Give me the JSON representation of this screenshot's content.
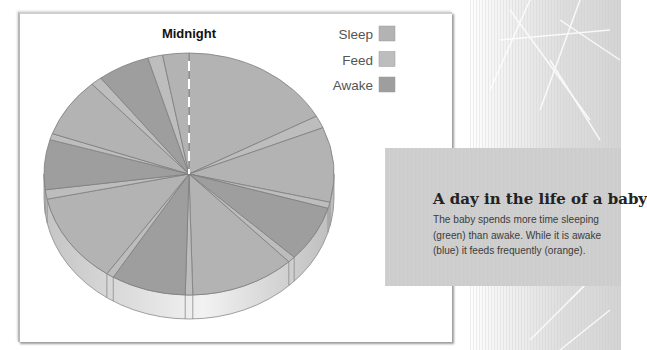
{
  "chart_data": {
    "type": "pie",
    "title": "Midnight",
    "start_label": "Midnight",
    "unit": "hours",
    "total": 24,
    "direction": "clockwise from midnight (top)",
    "legend": [
      {
        "label": "Sleep",
        "color": "#b3b3b3"
      },
      {
        "label": "Feed",
        "color": "#bdbdbd"
      },
      {
        "label": "Awake",
        "color": "#9e9e9e"
      }
    ],
    "legend_position": "top-right",
    "segments": [
      {
        "category": "Sleep",
        "hours": 4.1
      },
      {
        "category": "Feed",
        "hours": 0.4
      },
      {
        "category": "Sleep",
        "hours": 2.4
      },
      {
        "category": "Feed",
        "hours": 0.2
      },
      {
        "category": "Awake",
        "hours": 1.8
      },
      {
        "category": "Feed",
        "hours": 0.2
      },
      {
        "category": "Sleep",
        "hours": 2.8
      },
      {
        "category": "Feed",
        "hours": 0.2
      },
      {
        "category": "Awake",
        "hours": 2.0
      },
      {
        "category": "Feed",
        "hours": 0.2
      },
      {
        "category": "Sleep",
        "hours": 2.9
      },
      {
        "category": "Feed",
        "hours": 0.3
      },
      {
        "category": "Awake",
        "hours": 1.6
      },
      {
        "category": "Feed",
        "hours": 0.2
      },
      {
        "category": "Sleep",
        "hours": 1.9
      },
      {
        "category": "Feed",
        "hours": 0.3
      },
      {
        "category": "Awake",
        "hours": 1.4
      },
      {
        "category": "Feed",
        "hours": 0.4
      },
      {
        "category": "Sleep",
        "hours": 0.7
      }
    ]
  },
  "info": {
    "title": "A day in the life of a baby",
    "body": "The baby spends more time sleeping (green) than awake. While it is awake (blue) it feeds frequently (orange)."
  }
}
